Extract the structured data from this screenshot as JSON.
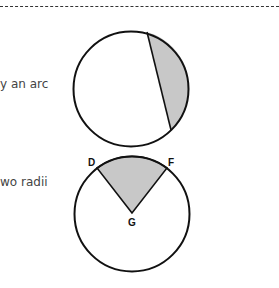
{
  "text_fragments": {
    "segment_caption_tail": "y an arc",
    "sector_caption_tail": "wo radii"
  },
  "figures": {
    "segment_circle": {
      "description": "Circle with shaded segment bounded by chord and arc",
      "fill": "#c8c8c8"
    },
    "sector_circle": {
      "description": "Circle with shaded sector bounded by two radii and arc",
      "fill": "#c8c8c8",
      "labels": {
        "d": "D",
        "f": "F",
        "g": "G"
      }
    }
  }
}
